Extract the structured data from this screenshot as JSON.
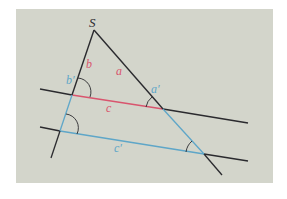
{
  "diagram": {
    "colors": {
      "background": "#d3d5cb",
      "page": "#ffffff",
      "black_line": "#2a2a2e",
      "red": "#d9556e",
      "blue": "#5ea6c8"
    },
    "labels": {
      "vertex": "S",
      "a": "a",
      "b": "b",
      "c": "c",
      "a_prime": "a′",
      "b_prime": "b′",
      "c_prime": "c′"
    },
    "points": {
      "S": [
        94,
        30
      ],
      "left_ray_end": [
        51,
        158
      ],
      "right_ray_end": [
        222,
        175
      ],
      "P1_left_line1": [
        72,
        95
      ],
      "P1_right_line1": [
        163,
        109
      ],
      "P2_left_line2": [
        60,
        132
      ],
      "P2_right_line2": [
        204,
        154
      ]
    },
    "parallel_lines": [
      {
        "name": "upper",
        "from": [
          40,
          89
        ],
        "to": [
          248,
          123
        ]
      },
      {
        "name": "lower",
        "from": [
          40,
          127
        ],
        "to": [
          248,
          161
        ]
      }
    ]
  }
}
